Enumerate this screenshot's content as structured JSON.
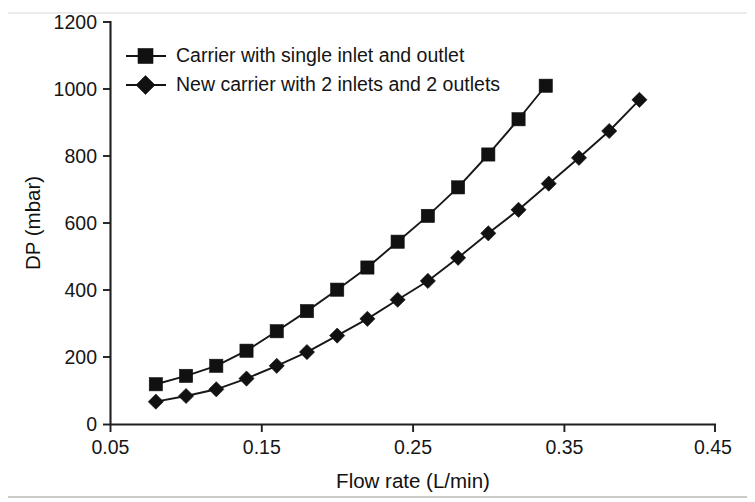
{
  "chart_data": {
    "type": "line",
    "title": "",
    "xlabel": "Flow rate (L/min)",
    "ylabel": "DP (mbar)",
    "xlim": [
      0.05,
      0.45
    ],
    "ylim": [
      0,
      1200
    ],
    "xticks": [
      0.05,
      0.15,
      0.25,
      0.35,
      0.45
    ],
    "xtick_labels": [
      "0.05",
      "0.15",
      "0.25",
      "0.35",
      "0.45"
    ],
    "yticks": [
      0,
      200,
      400,
      600,
      800,
      1000,
      1200
    ],
    "ytick_labels": [
      "0",
      "200",
      "400",
      "600",
      "800",
      "1000",
      "1200"
    ],
    "grid": false,
    "legend_position": "upper left",
    "series": [
      {
        "name": "Carrier with single inlet and outlet",
        "marker": "square",
        "color": "#111111",
        "x": [
          0.08,
          0.1,
          0.12,
          0.14,
          0.16,
          0.18,
          0.2,
          0.22,
          0.24,
          0.26,
          0.28,
          0.3,
          0.32,
          0.338
        ],
        "y": [
          120,
          145,
          175,
          220,
          278,
          338,
          402,
          468,
          545,
          622,
          707,
          805,
          910,
          1010
        ]
      },
      {
        "name": "New carrier with 2 inlets and 2 outlets",
        "marker": "diamond",
        "color": "#111111",
        "x": [
          0.08,
          0.1,
          0.12,
          0.14,
          0.16,
          0.18,
          0.2,
          0.22,
          0.24,
          0.26,
          0.28,
          0.3,
          0.32,
          0.34,
          0.36,
          0.38,
          0.4
        ],
        "y": [
          68,
          85,
          105,
          137,
          175,
          216,
          265,
          315,
          372,
          428,
          497,
          570,
          640,
          718,
          795,
          875,
          968
        ]
      }
    ]
  },
  "legend": {
    "entries": [
      {
        "label": "Carrier with single inlet and outlet",
        "marker": "square-marker"
      },
      {
        "label": "New carrier with 2 inlets and 2 outlets",
        "marker": "diamond-marker"
      }
    ]
  },
  "axis": {
    "x_title": "Flow rate (L/min)",
    "y_title": "DP (mbar)"
  }
}
